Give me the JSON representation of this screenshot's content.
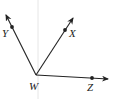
{
  "diagram": {
    "type": "rays-from-common-vertex",
    "vertex": {
      "label": "W",
      "x": 36,
      "y": 75
    },
    "rays": [
      {
        "name": "WY",
        "point": {
          "label": "Y",
          "x": 12,
          "y": 27
        },
        "tip": {
          "x": 5,
          "y": 13
        }
      },
      {
        "name": "WX",
        "point": {
          "label": "X",
          "x": 65,
          "y": 30
        },
        "tip": {
          "x": 74,
          "y": 16
        }
      },
      {
        "name": "WZ",
        "point": {
          "label": "Z",
          "x": 92,
          "y": 78
        },
        "tip": {
          "x": 110,
          "y": 79
        }
      }
    ],
    "labels": {
      "W": "W",
      "X": "X",
      "Y": "Y",
      "Z": "Z"
    },
    "colors": {
      "stroke": "#222222",
      "guide": "#e6e6e6"
    }
  }
}
